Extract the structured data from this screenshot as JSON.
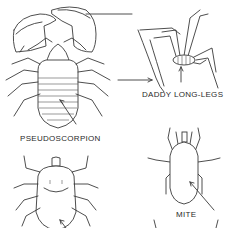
{
  "figure": {
    "labels": {
      "pseudoscorpion": "PSEUDOSCORPION",
      "daddy_long_legs": "DADDY LONG-LEGS",
      "mite": "MITE"
    },
    "colors": {
      "line": "#3a3a3a",
      "background": "#ffffff",
      "text": "#2a2a2a"
    }
  }
}
